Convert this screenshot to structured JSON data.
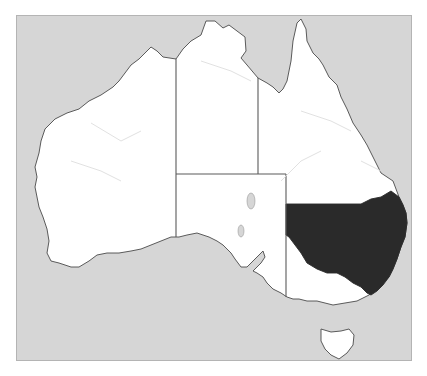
{
  "map": {
    "title": "Australia - New South Wales highlighted",
    "highlighted_region": "New South Wales",
    "regions": [
      {
        "name": "Western Australia",
        "highlighted": false
      },
      {
        "name": "Northern Territory",
        "highlighted": false
      },
      {
        "name": "Queensland",
        "highlighted": false
      },
      {
        "name": "South Australia",
        "highlighted": false
      },
      {
        "name": "New South Wales",
        "highlighted": true
      },
      {
        "name": "Victoria",
        "highlighted": false
      },
      {
        "name": "Tasmania",
        "highlighted": false
      }
    ],
    "colors": {
      "ocean": "#d6d6d6",
      "land": "#ffffff",
      "highlight": "#2a2a2a",
      "coastline": "#4a4a4a",
      "rivers": "#dedede"
    }
  }
}
